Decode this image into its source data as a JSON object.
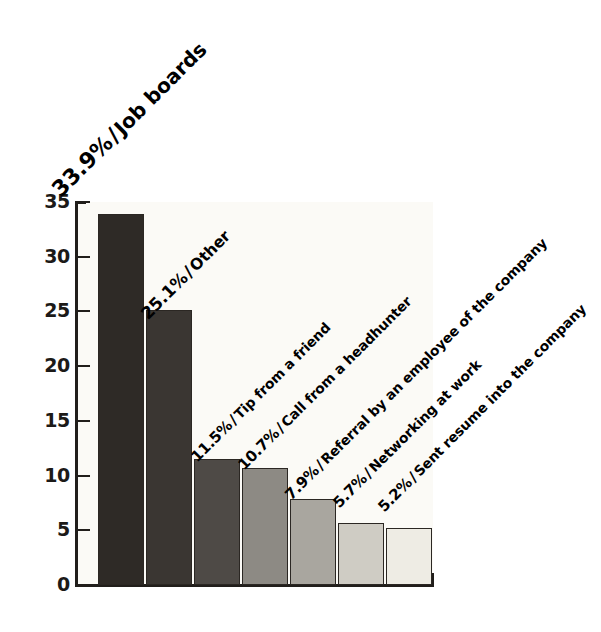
{
  "chart_data": {
    "type": "bar",
    "title": "",
    "subtitle": "",
    "xlabel": "",
    "ylabel": "",
    "ylim": [
      0,
      35
    ],
    "yticks": [
      0,
      5,
      10,
      15,
      20,
      25,
      30,
      35
    ],
    "ytick_labels": [
      "0",
      "5",
      "10",
      "15",
      "20",
      "25",
      "30",
      "35"
    ],
    "grid": false,
    "legend": "none",
    "categories": [
      "Job boards",
      "Other",
      "Tip from a friend",
      "Call from a headhunter",
      "Referral by an employee of the company",
      "Networking at work",
      "Sent resume into the company"
    ],
    "values": [
      33.9,
      25.1,
      11.5,
      10.7,
      7.9,
      5.7,
      5.2
    ],
    "value_labels": [
      "33.9%",
      "25.1%",
      "11.5%",
      "10.7%",
      "7.9%",
      "5.7%",
      "5.2%"
    ],
    "bar_colors": [
      "#2e2a26",
      "#3a3632",
      "#4e4a46",
      "#8d8a84",
      "#a9a69f",
      "#cfccc4",
      "#eeece4"
    ],
    "bar_border_color": "#2b2723",
    "annotations": [
      {
        "text": "33.9% / Job boards",
        "percent": "33.9%",
        "separator": "/",
        "name": "Job boards"
      },
      {
        "text": "25.1% / Other",
        "percent": "25.1%",
        "separator": "/",
        "name": "Other"
      },
      {
        "text": "11.5% / Tip from a friend",
        "percent": "11.5%",
        "separator": "/",
        "name": "Tip from a friend"
      },
      {
        "text": "10.7% / Call from a headhunter",
        "percent": "10.7%",
        "separator": "/",
        "name": "Call from a headhunter"
      },
      {
        "text": "7.9% / Referral by an employee of the company",
        "percent": "7.9%",
        "separator": "/",
        "name": "Referral by an employee of the company"
      },
      {
        "text": "5.7% / Networking at work",
        "percent": "5.7%",
        "separator": "/",
        "name": "Networking at work"
      },
      {
        "text": "5.2% / Sent resume into the company",
        "percent": "5.2%",
        "separator": "/",
        "name": "Sent resume into the company"
      }
    ]
  },
  "colors": {
    "background": "#ffffff",
    "plot_background": "#fbfaf6",
    "axis": "#211e1b",
    "text": "#1c1a18"
  }
}
